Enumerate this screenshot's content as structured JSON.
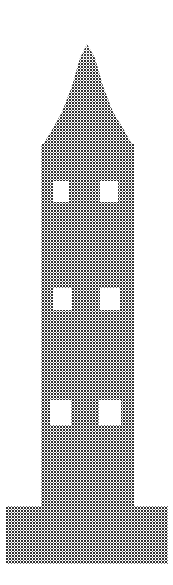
{
  "image": {
    "title": "Dithered halftone illustration of a tower with spire",
    "subject": "church-tower",
    "width": 173,
    "height": 585,
    "background_color": "#ffffff",
    "ink_color": "#3a3a3a",
    "render_style": "bitmap-dither-halftone",
    "dither": {
      "pattern": "crosshatch",
      "cell_pitch_px": 3,
      "dot_radius_px": 0.95,
      "coverage": "medium-dark"
    }
  },
  "geometry": {
    "spire": {
      "name": "spire",
      "apex_x": 87,
      "apex_y": 44,
      "base_y": 150,
      "left_x": 41,
      "right_x": 134,
      "shoulder_y": 120
    },
    "shaft": {
      "name": "tower-shaft",
      "left_x": 41,
      "right_x": 134,
      "top_y": 145,
      "bottom_y": 508
    },
    "plinth": {
      "name": "base-plinth",
      "left_x": 6,
      "right_x": 168,
      "top_y": 506,
      "bottom_y": 564
    },
    "windows": [
      {
        "name": "window-upper-left",
        "x": 53,
        "y": 181,
        "w": 16,
        "h": 21
      },
      {
        "name": "window-upper-right",
        "x": 100,
        "y": 181,
        "w": 18,
        "h": 21
      },
      {
        "name": "window-middle-left",
        "x": 53,
        "y": 288,
        "w": 19,
        "h": 22
      },
      {
        "name": "window-middle-right",
        "x": 100,
        "y": 288,
        "w": 20,
        "h": 22
      },
      {
        "name": "window-lower-left",
        "x": 50,
        "y": 400,
        "w": 21,
        "h": 25
      },
      {
        "name": "window-lower-right",
        "x": 99,
        "y": 400,
        "w": 22,
        "h": 25
      }
    ]
  },
  "labels": {
    "alt_text": "Tower with pointed spire, three pairs of windows and a wide stepped base, drawn as a coarse black-and-white dither"
  }
}
